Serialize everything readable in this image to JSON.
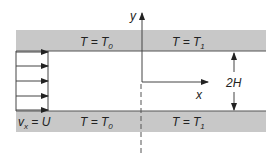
{
  "diagram": {
    "colors": {
      "wall": "#c8c8c8",
      "line": "#444444",
      "text": "#222222"
    },
    "top_wall": {
      "left_label": "T = T",
      "left_sub": "0",
      "right_label": "T = T",
      "right_sub": "1"
    },
    "bottom_wall": {
      "left_label": "T = T",
      "left_sub": "0",
      "right_label": "T = T",
      "right_sub": "1"
    },
    "inlet_velocity": {
      "label_v": "v",
      "label_sub": "x",
      "label_rest": " = U",
      "arrow_count": 5
    },
    "axes": {
      "y_label": "y",
      "x_label": "x"
    },
    "gap_label": "2H"
  }
}
